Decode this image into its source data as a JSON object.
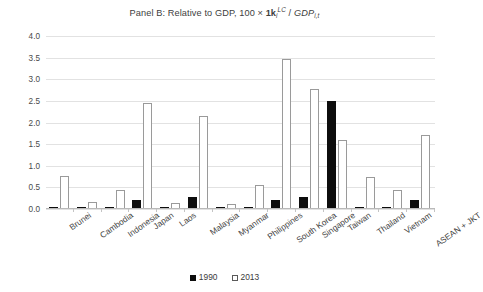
{
  "chart_data": {
    "type": "bar",
    "title_parts": {
      "lead": "Panel B: Relative to GDP, 100 × ",
      "k_symbol": "1k",
      "k_sub": "i",
      "k_sup": "LC",
      "slash": " / ",
      "gdp": "GDP",
      "gdp_sub": "i,t"
    },
    "categories": [
      "Brunei",
      "Cambodia",
      "Indonesia",
      "Japan",
      "Laos",
      "Malaysia",
      "Myanmar",
      "Philippines",
      "South Korea",
      "Singapore",
      "Taiwan",
      "Thailand",
      "Vietnam",
      "ASEAN + JKT"
    ],
    "series": [
      {
        "name": "1990",
        "color": "#0d0d0d",
        "fill": "solid",
        "values": [
          0.03,
          0.01,
          0.03,
          0.2,
          0.01,
          0.27,
          0.01,
          0.01,
          0.22,
          0.28,
          2.5,
          0.03,
          0.03,
          0.2
        ]
      },
      {
        "name": "2013",
        "color": "#ffffff",
        "fill": "hollow",
        "values": [
          0.77,
          0.16,
          0.43,
          2.44,
          0.13,
          2.14,
          0.12,
          0.55,
          3.48,
          2.77,
          1.59,
          0.75,
          0.44,
          1.72
        ]
      }
    ],
    "xlabel": "",
    "ylabel": "",
    "ylim": [
      0.0,
      4.0
    ],
    "yticks": [
      "0.0",
      "0.5",
      "1.0",
      "1.5",
      "2.0",
      "2.5",
      "3.0",
      "3.5",
      "4.0"
    ],
    "ytick_values": [
      0.0,
      0.5,
      1.0,
      1.5,
      2.0,
      2.5,
      3.0,
      3.5,
      4.0
    ],
    "grid": true,
    "grid_color": "#e2e2e2",
    "legend_position": "bottom",
    "legend_entries": [
      "1990",
      "2013"
    ],
    "background": "#ffffff"
  }
}
